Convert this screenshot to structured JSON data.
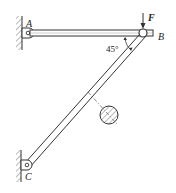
{
  "diagram": {
    "labels": {
      "A": "A",
      "B": "B",
      "C": "C",
      "force": "F",
      "angle": "45°"
    },
    "colors": {
      "line": "#333333",
      "background": "#ffffff"
    }
  }
}
